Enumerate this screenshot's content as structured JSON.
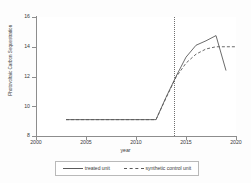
{
  "chart_data": {
    "type": "line",
    "title": "",
    "subtitle": "",
    "xlabel": "year",
    "ylabel": "Photovoltaic Carbon Sequestration",
    "xlim": [
      2000,
      2020
    ],
    "ylim": [
      8,
      16
    ],
    "xticks": [
      2000,
      2005,
      2010,
      2015,
      2020
    ],
    "xtick_labels": [
      "2000",
      "2005",
      "2010",
      "2015",
      "2020"
    ],
    "yticks": [
      8,
      10,
      12,
      14,
      16
    ],
    "ytick_labels": [
      "8",
      "10",
      "12",
      "14",
      "16"
    ],
    "grid": true,
    "grid_axis": "y",
    "legend_position": "bottom",
    "annotations": [
      {
        "type": "vline",
        "x": 2013.8,
        "style": "dotted",
        "label": ""
      }
    ],
    "series": [
      {
        "name": "treated unit",
        "style": "solid",
        "color": "#5a5a5a",
        "x": [
          2003,
          2004,
          2005,
          2006,
          2007,
          2008,
          2009,
          2010,
          2011,
          2012,
          2013,
          2014,
          2015,
          2016,
          2017,
          2018,
          2019
        ],
        "values": [
          9.1,
          9.1,
          9.1,
          9.1,
          9.1,
          9.1,
          9.1,
          9.1,
          9.1,
          9.1,
          10.6,
          12.0,
          13.3,
          14.1,
          14.4,
          14.75,
          12.4
        ]
      },
      {
        "name": "synthetic control unit",
        "style": "dashed",
        "color": "#5a5a5a",
        "x": [
          2003,
          2004,
          2005,
          2006,
          2007,
          2008,
          2009,
          2010,
          2011,
          2012,
          2013,
          2014,
          2015,
          2016,
          2017,
          2018,
          2019,
          2020
        ],
        "values": [
          9.1,
          9.1,
          9.1,
          9.1,
          9.1,
          9.1,
          9.1,
          9.1,
          9.1,
          9.1,
          10.55,
          11.95,
          12.9,
          13.5,
          13.85,
          14.0,
          14.0,
          14.0
        ]
      }
    ]
  },
  "legend": {
    "entries": [
      {
        "label": "treated unit",
        "style": "solid"
      },
      {
        "label": "synthetic control unit",
        "style": "dashed"
      }
    ]
  }
}
